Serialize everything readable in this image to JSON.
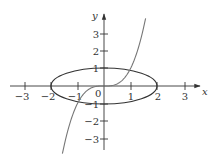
{
  "chart_data": {
    "type": "line",
    "title": "",
    "xlabel": "x",
    "ylabel": "y",
    "xlim": [
      -3.5,
      3.7
    ],
    "ylim": [
      -3.7,
      4.1
    ],
    "grid": false,
    "x_ticks": [
      -3,
      -2,
      -1,
      1,
      2,
      3
    ],
    "y_ticks": [
      -3,
      -2,
      -1,
      1,
      2,
      3
    ],
    "x_tick_labels": [
      "−3",
      "−2",
      "−1",
      "1",
      "2",
      "3"
    ],
    "y_tick_labels": [
      "−3",
      "−2",
      "−1",
      "1",
      "2",
      "3"
    ],
    "origin_label": "0",
    "series": [
      {
        "name": "ellipse x^2/4 + y^2 = 1",
        "kind": "ellipse",
        "center": [
          0,
          0
        ],
        "rx": 2,
        "ry": 1,
        "color": "#333333"
      },
      {
        "name": "cubic y = x^3",
        "kind": "function",
        "x": [
          -1.57,
          -1.4,
          -1.2,
          -1.0,
          -0.8,
          -0.6,
          -0.4,
          -0.2,
          0,
          0.2,
          0.4,
          0.6,
          0.8,
          1.0,
          1.2,
          1.4,
          1.57
        ],
        "y": [
          -3.87,
          -2.74,
          -1.73,
          -1.0,
          -0.51,
          -0.22,
          -0.06,
          -0.01,
          0,
          0.01,
          0.06,
          0.22,
          0.51,
          1.0,
          1.73,
          2.74,
          3.87
        ],
        "color": "#777777"
      }
    ]
  },
  "axes": {
    "x_label": "x",
    "y_label": "y",
    "origin": "0"
  },
  "colors": {
    "axis": "#333333",
    "ellipse": "#333333",
    "curve": "#777777"
  }
}
